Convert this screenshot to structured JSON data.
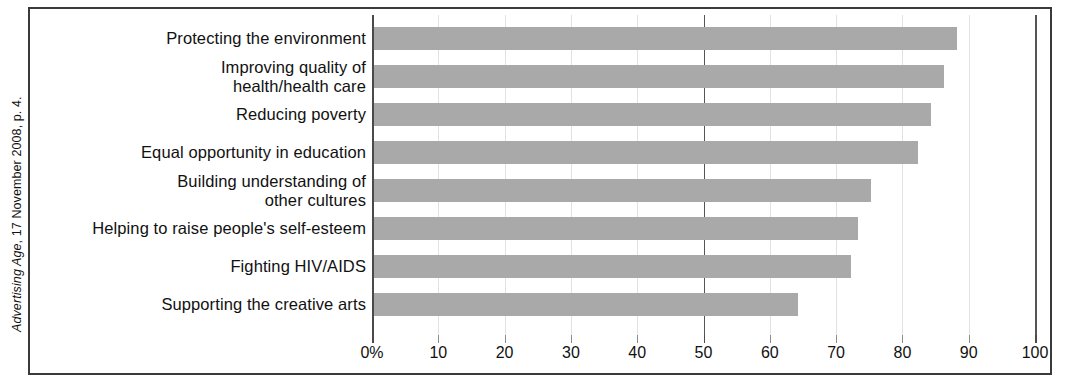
{
  "source_caption": {
    "publication": "Advertising Age",
    "rest": ", 17 November 2008, p. 4."
  },
  "chart_data": {
    "type": "bar",
    "orientation": "horizontal",
    "title": "",
    "xlabel": "",
    "ylabel": "",
    "xlim": [
      0,
      100
    ],
    "grid": true,
    "legend": null,
    "reference_lines": [
      50,
      100
    ],
    "xticks": [
      0,
      10,
      20,
      30,
      40,
      50,
      60,
      70,
      80,
      90,
      100
    ],
    "xticklabels": [
      "0%",
      "10",
      "20",
      "30",
      "40",
      "50",
      "60",
      "70",
      "80",
      "90",
      "100"
    ],
    "categories": [
      "Protecting the environment",
      "Improving quality of\nhealth/health care",
      "Reducing poverty",
      "Equal opportunity in education",
      "Building understanding of\nother cultures",
      "Helping to raise people's self-esteem",
      "Fighting HIV/AIDS",
      "Supporting the creative arts"
    ],
    "values": [
      88,
      86,
      84,
      82,
      75,
      73,
      72,
      64
    ],
    "bar_color": "#a9a9a9",
    "axis_color": "#4a4a4a",
    "grid_color": "#e2e2e2"
  }
}
